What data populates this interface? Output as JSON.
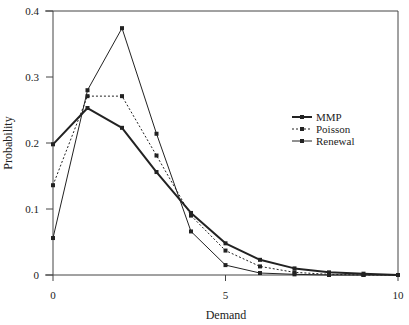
{
  "chart_data": {
    "type": "line",
    "title": "",
    "xlabel": "Demand",
    "ylabel": "Probability",
    "x": [
      0,
      1,
      2,
      3,
      4,
      5,
      6,
      7,
      8,
      9,
      10
    ],
    "xlim": [
      0,
      10
    ],
    "ylim": [
      0,
      0.4
    ],
    "xticks": [
      0,
      5,
      10
    ],
    "xtick_labels": [
      "0",
      "5",
      "10"
    ],
    "yticks": [
      0,
      0.1,
      0.2,
      0.3,
      0.4
    ],
    "ytick_labels": [
      "0",
      "0.1",
      "0.2",
      "0.3",
      "0.4"
    ],
    "grid": false,
    "legend_position": "right-center",
    "series": [
      {
        "name": "MMP",
        "style": "thick-solid",
        "values": [
          0.198,
          0.253,
          0.223,
          0.156,
          0.094,
          0.048,
          0.023,
          0.01,
          0.004,
          0.002,
          0.0
        ]
      },
      {
        "name": "Poisson",
        "style": "dotted",
        "values": [
          0.136,
          0.271,
          0.271,
          0.181,
          0.09,
          0.037,
          0.013,
          0.004,
          0.001,
          0.0,
          0.0
        ]
      },
      {
        "name": "Renewal",
        "style": "thin-solid",
        "values": [
          0.056,
          0.28,
          0.374,
          0.214,
          0.066,
          0.015,
          0.003,
          0.001,
          0.0,
          0.0,
          0.0
        ]
      }
    ]
  },
  "colors": {
    "line": "#222222",
    "axis": "#444444"
  }
}
